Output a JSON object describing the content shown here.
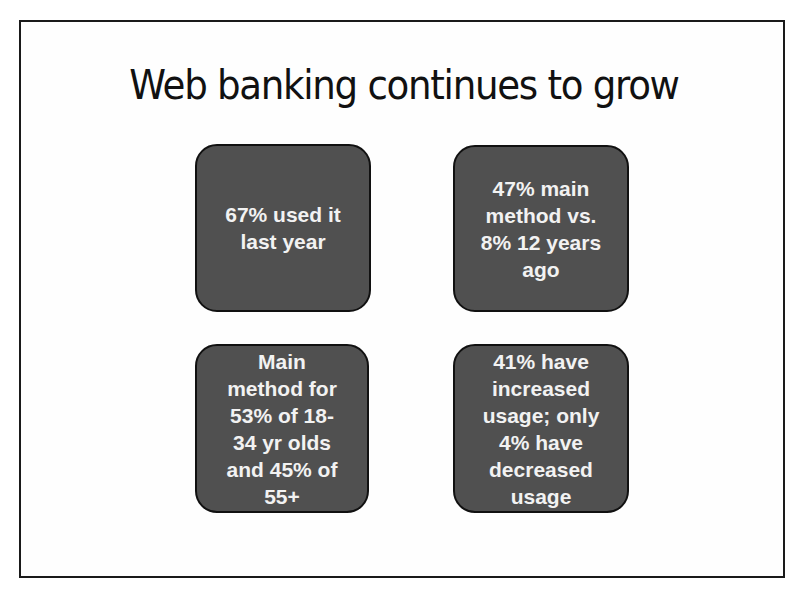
{
  "slide": {
    "title": "Web banking continues to grow",
    "boxes": [
      {
        "text": "67% used it\nlast year"
      },
      {
        "text": "47% main\nmethod vs.\n8% 12 years\nago"
      },
      {
        "text": "Main\nmethod for\n53% of 18-\n34 yr olds\nand 45% of\n55+"
      },
      {
        "text": "41% have\nincreased\nusage; only\n4% have\ndecreased\nusage"
      }
    ]
  },
  "colors": {
    "box_fill": "#505050",
    "box_border": "#111111",
    "box_text": "#f2f2f2",
    "title_text": "#111111",
    "slide_border": "#1a1a1a"
  }
}
